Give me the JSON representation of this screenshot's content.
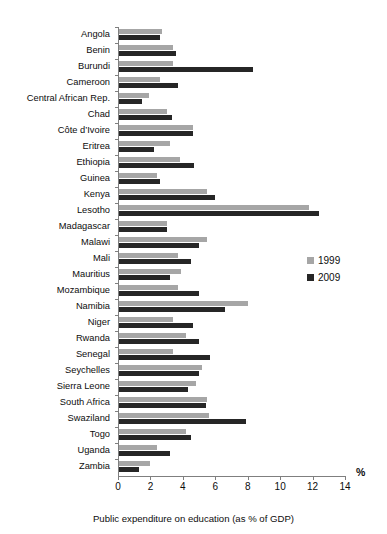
{
  "chart_data": {
    "type": "bar",
    "orientation": "horizontal",
    "title": "",
    "xlabel": "Public expenditure on education (as % of GDP)",
    "ylabel": "",
    "unit_label": "%",
    "xlim": [
      0,
      14
    ],
    "xticks": [
      0,
      2,
      4,
      6,
      8,
      10,
      12,
      14
    ],
    "grid": false,
    "legend_position": "right-middle",
    "categories": [
      "Angola",
      "Benin",
      "Burundi",
      "Cameroon",
      "Central African Rep.",
      "Chad",
      "Côte d’Ivoire",
      "Eritrea",
      "Ethiopia",
      "Guinea",
      "Kenya",
      "Lesotho",
      "Madagascar",
      "Malawi",
      "Mali",
      "Mauritius",
      "Mozambique",
      "Namibia",
      "Niger",
      "Rwanda",
      "Senegal",
      "Seychelles",
      "Sierra Leone",
      "South Africa",
      "Swaziland",
      "Togo",
      "Uganda",
      "Zambia"
    ],
    "series": [
      {
        "name": "1999",
        "color": "#a6a6a6",
        "values": [
          2.7,
          3.4,
          3.4,
          2.6,
          1.9,
          3.0,
          4.6,
          3.2,
          3.8,
          2.4,
          5.5,
          11.8,
          3.0,
          5.5,
          3.7,
          3.9,
          3.7,
          8.0,
          3.4,
          4.2,
          3.4,
          5.2,
          4.8,
          5.5,
          5.6,
          4.2,
          2.4,
          2.0
        ]
      },
      {
        "name": "2009",
        "color": "#262626",
        "values": [
          2.6,
          3.6,
          8.3,
          3.7,
          1.5,
          3.3,
          4.6,
          2.2,
          4.7,
          2.6,
          6.0,
          12.4,
          3.0,
          5.0,
          4.5,
          3.2,
          5.0,
          6.6,
          4.6,
          5.0,
          5.7,
          5.0,
          4.3,
          5.4,
          7.9,
          4.5,
          3.2,
          1.3
        ]
      }
    ]
  },
  "legend": {
    "items": [
      {
        "label": "1999",
        "color": "#a6a6a6"
      },
      {
        "label": "2009",
        "color": "#262626"
      }
    ]
  },
  "axis": {
    "unit": "%",
    "caption": "Public expenditure on education (as % of GDP)"
  },
  "colors": {
    "series_1999": "#a6a6a6",
    "series_2009": "#262626",
    "axis_line": "#7f7f7f",
    "text": "#0d0d0d",
    "background": "#ffffff"
  }
}
